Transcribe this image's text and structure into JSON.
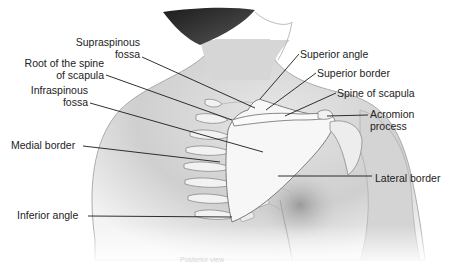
{
  "figure": {
    "labels": [
      {
        "id": "supraspinous-fossa",
        "lines": [
          "Supraspinous",
          "fossa"
        ],
        "x": 68,
        "y": 36,
        "align": "right",
        "width": 72
      },
      {
        "id": "root-of-spine",
        "lines": [
          "Root of the spine",
          "of scapula"
        ],
        "x": 22,
        "y": 57,
        "align": "right",
        "width": 82
      },
      {
        "id": "infraspinous-fossa",
        "lines": [
          "Infraspinous",
          "fossa"
        ],
        "x": 26,
        "y": 84,
        "align": "right",
        "width": 62
      },
      {
        "id": "medial-border",
        "lines": [
          "Medial border"
        ],
        "x": 11,
        "y": 139,
        "align": "left",
        "width": 70
      },
      {
        "id": "inferior-angle",
        "lines": [
          "Inferior angle"
        ],
        "x": 17,
        "y": 209,
        "align": "left",
        "width": 70
      },
      {
        "id": "superior-angle",
        "lines": [
          "Superior angle"
        ],
        "x": 300,
        "y": 48,
        "align": "left",
        "width": 80
      },
      {
        "id": "superior-border",
        "lines": [
          "Superior border"
        ],
        "x": 317,
        "y": 67,
        "align": "left",
        "width": 80
      },
      {
        "id": "spine-of-scapula",
        "lines": [
          "Spine of scapula"
        ],
        "x": 337,
        "y": 87,
        "align": "left",
        "width": 90
      },
      {
        "id": "acromion-process",
        "lines": [
          "Acromion",
          "process"
        ],
        "x": 370,
        "y": 108,
        "align": "left",
        "width": 60
      },
      {
        "id": "lateral-border",
        "lines": [
          "Lateral border"
        ],
        "x": 375,
        "y": 172,
        "align": "left",
        "width": 80
      }
    ],
    "leaders": [
      {
        "for": "supraspinous-fossa",
        "x1": 142,
        "y1": 57,
        "x2": 255,
        "y2": 108
      },
      {
        "for": "root-of-spine",
        "x1": 106,
        "y1": 75,
        "x2": 232,
        "y2": 120
      },
      {
        "for": "infraspinous-fossa",
        "x1": 90,
        "y1": 103,
        "x2": 263,
        "y2": 152
      },
      {
        "for": "medial-border",
        "x1": 83,
        "y1": 146,
        "x2": 220,
        "y2": 162
      },
      {
        "for": "inferior-angle",
        "x1": 88,
        "y1": 216,
        "x2": 232,
        "y2": 217
      },
      {
        "for": "superior-angle",
        "x1": 299,
        "y1": 54,
        "x2": 260,
        "y2": 99
      },
      {
        "for": "superior-border",
        "x1": 316,
        "y1": 73,
        "x2": 266,
        "y2": 110
      },
      {
        "for": "spine-of-scapula",
        "x1": 336,
        "y1": 93,
        "x2": 285,
        "y2": 116
      },
      {
        "for": "acromion-process",
        "x1": 368,
        "y1": 115,
        "x2": 327,
        "y2": 116
      },
      {
        "for": "lateral-border",
        "x1": 372,
        "y1": 176,
        "x2": 278,
        "y2": 176
      }
    ],
    "caption": "Posterior view"
  },
  "colors": {
    "background": "#ffffff",
    "skin_light": "#dcdcdc",
    "skin_mid": "#bdbdbd",
    "skin_dark": "#8e8e8e",
    "hair": "#2a2a2a",
    "bone": "#f4f4f4",
    "bone_outline": "#9a9a9a",
    "leader": "#1a1a1a",
    "text": "#222222"
  }
}
